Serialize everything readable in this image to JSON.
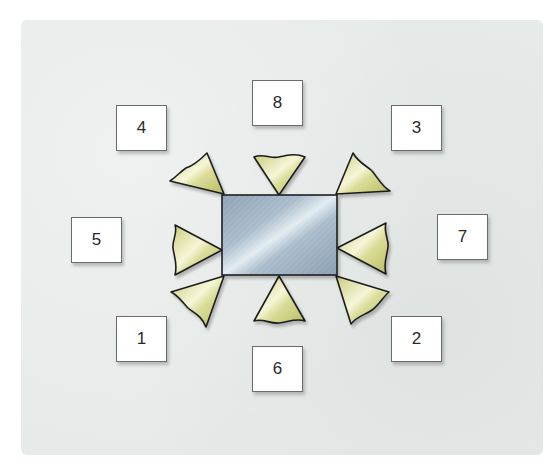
{
  "diagram": {
    "title": "",
    "colors": {
      "background_panel": "#e6eae8",
      "table_fill": "#9fb3c4",
      "table_highlight": "#dde8ef",
      "chair_fill": "#d3d690",
      "chair_highlight": "#f7f7dc",
      "outline": "#1e1e1e",
      "label_box": "#ffffff"
    },
    "table": {
      "shape": "rectangle",
      "x": 222,
      "y": 195,
      "width": 115,
      "height": 80
    },
    "seat_labels": [
      {
        "id": "seat-4",
        "label": "4",
        "x": 116,
        "y": 105
      },
      {
        "id": "seat-8",
        "label": "8",
        "x": 252,
        "y": 80
      },
      {
        "id": "seat-3",
        "label": "3",
        "x": 391,
        "y": 105
      },
      {
        "id": "seat-5",
        "label": "5",
        "x": 71,
        "y": 217
      },
      {
        "id": "seat-7",
        "label": "7",
        "x": 437,
        "y": 214
      },
      {
        "id": "seat-1",
        "label": "1",
        "x": 116,
        "y": 316
      },
      {
        "id": "seat-6",
        "label": "6",
        "x": 252,
        "y": 346
      },
      {
        "id": "seat-2",
        "label": "2",
        "x": 391,
        "y": 316
      }
    ],
    "chairs": [
      {
        "position": "top-left",
        "seat": "4"
      },
      {
        "position": "top-center",
        "seat": "8"
      },
      {
        "position": "top-right",
        "seat": "3"
      },
      {
        "position": "left",
        "seat": "5"
      },
      {
        "position": "right",
        "seat": "7"
      },
      {
        "position": "bottom-left",
        "seat": "1"
      },
      {
        "position": "bottom-center",
        "seat": "6"
      },
      {
        "position": "bottom-right",
        "seat": "2"
      }
    ]
  }
}
